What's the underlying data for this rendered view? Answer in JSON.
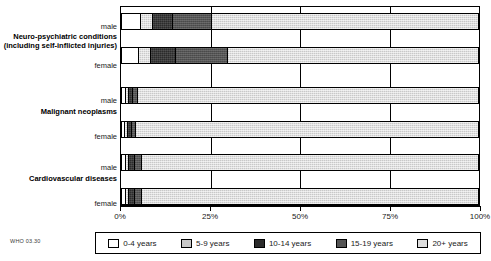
{
  "source_note": "WHO 03.30",
  "chart_data": {
    "type": "bar",
    "orientation": "horizontal",
    "stacked": true,
    "normalized_percent": true,
    "title": "",
    "subtitle": "",
    "xlabel": "",
    "ylabel": "",
    "xlim": [
      0,
      100
    ],
    "grid": true,
    "legend_position": "bottom",
    "xticks": [
      0,
      25,
      50,
      75,
      100
    ],
    "xtick_labels": [
      "0%",
      "25%",
      "50%",
      "75%",
      "100%"
    ],
    "categories": [
      "Neuro-psychiatric conditions (including self-inflicted injuries)",
      "Malignant neoplasms",
      "Cardiovascular diseases"
    ],
    "series": [
      {
        "name": "0-4 years",
        "color": "#ffffff"
      },
      {
        "name": "5-9 years",
        "color": "#c9c9c9"
      },
      {
        "name": "10-14 years",
        "color": "#2b2b2b"
      },
      {
        "name": "15-19 years",
        "color": "#545454"
      },
      {
        "name": "20+ years",
        "color": "#dedede"
      }
    ],
    "bars": [
      {
        "group": "Neuro-psychiatric conditions (including self-inflicted injuries)",
        "group_lines": [
          "Neuro-psychiatric conditions",
          "(including self-inflicted injuries)"
        ],
        "sex": "male",
        "values": [
          5.0,
          3.5,
          5.5,
          11.0,
          75.0
        ]
      },
      {
        "group": "Neuro-psychiatric conditions (including self-inflicted injuries)",
        "group_lines": [
          "Neuro-psychiatric conditions",
          "(including self-inflicted injuries)"
        ],
        "sex": "female",
        "values": [
          4.5,
          3.5,
          7.0,
          14.5,
          70.5
        ]
      },
      {
        "group": "Malignant neoplasms",
        "group_lines": [
          "Malignant neoplasms"
        ],
        "sex": "male",
        "values": [
          0.8,
          0.8,
          1.2,
          1.4,
          95.8
        ]
      },
      {
        "group": "Malignant neoplasms",
        "group_lines": [
          "Malignant neoplasms"
        ],
        "sex": "female",
        "values": [
          0.7,
          0.7,
          1.0,
          1.3,
          96.3
        ]
      },
      {
        "group": "Cardiovascular diseases",
        "group_lines": [
          "Cardiovascular diseases"
        ],
        "sex": "male",
        "values": [
          0.9,
          0.9,
          1.5,
          2.0,
          94.7
        ]
      },
      {
        "group": "Cardiovascular diseases",
        "group_lines": [
          "Cardiovascular diseases"
        ],
        "sex": "female",
        "values": [
          0.9,
          0.9,
          1.5,
          2.1,
          94.6
        ]
      }
    ],
    "legend": [
      {
        "label": "0-4 years",
        "color": "#ffffff"
      },
      {
        "label": "5-9 years",
        "color": "#c9c9c9"
      },
      {
        "label": "10-14 years",
        "color": "#2b2b2b"
      },
      {
        "label": "15-19 years",
        "color": "#545454"
      },
      {
        "label": "20+ years",
        "color": "#dedede"
      }
    ]
  }
}
